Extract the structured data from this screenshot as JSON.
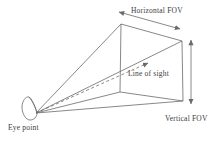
{
  "diagram": {
    "type": "viewing-frustum-field-of-view-diagram",
    "labels": {
      "horizontal_fov": "Horizontal FOV",
      "vertical_fov": "Vertical FOV",
      "line_of_sight": "Line of sight",
      "eye_point": "Eye point"
    },
    "colors": {
      "background": "#ffffff",
      "line": "#6a6a6a",
      "text": "#3a3a3a"
    }
  }
}
